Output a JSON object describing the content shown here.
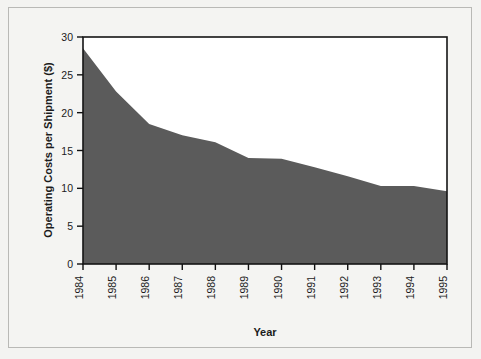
{
  "chart_data": {
    "type": "area",
    "title": "",
    "xlabel": "Year",
    "ylabel": "Operating Costs per Shipment ($)",
    "categories": [
      "1984",
      "1985",
      "1986",
      "1987",
      "1988",
      "1989",
      "1990",
      "1991",
      "1992",
      "1993",
      "1994",
      "1995"
    ],
    "values": [
      28.5,
      22.8,
      18.5,
      17.0,
      16.1,
      14.0,
      13.9,
      12.8,
      11.6,
      10.3,
      10.3,
      9.6
    ],
    "series": [
      {
        "name": "Operating Costs per Shipment",
        "values": [
          28.5,
          22.8,
          18.5,
          17.0,
          16.1,
          14.0,
          13.9,
          12.8,
          11.6,
          10.3,
          10.3,
          9.6
        ]
      }
    ],
    "ylim": [
      0,
      30
    ],
    "yticks": [
      0,
      5,
      10,
      15,
      20,
      25,
      30
    ],
    "ytick_labels": [
      "0",
      "5",
      "10",
      "15",
      "20",
      "25",
      "30"
    ],
    "xlim": [
      "1984",
      "1995"
    ],
    "grid": false,
    "legend": false,
    "legend_position": "none",
    "fill_color": "#5b5b5b",
    "plot_background": "#ffffff",
    "axis_color": "#111111",
    "page_background": "#f3f3f1",
    "xtick_rotation": -90
  },
  "axes": {
    "y_axis_label": "Operating Costs per Shipment ($)",
    "x_axis_label": "Year"
  }
}
